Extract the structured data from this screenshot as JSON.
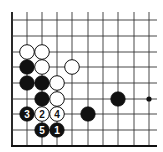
{
  "diagram": {
    "type": "go-board-fragment",
    "grid": {
      "columns_x": [
        12,
        27,
        42,
        57,
        72,
        88,
        103,
        118,
        134,
        149
      ],
      "rows_y": [
        20,
        36,
        52,
        67,
        83,
        99,
        114,
        130
      ],
      "top_y": 12,
      "right_x": 157,
      "bottom_edge_y": 146,
      "left_edge_x": 12,
      "line_color": "#333333",
      "edge_color": "#111111"
    },
    "stone_radius": 7.3,
    "colors": {
      "black": "#111111",
      "white": "#ffffff",
      "outline": "#111111"
    },
    "stones": [
      {
        "color": "white",
        "col": 1,
        "row": 2,
        "label": ""
      },
      {
        "color": "white",
        "col": 2,
        "row": 2,
        "label": ""
      },
      {
        "color": "black",
        "col": 1,
        "row": 3,
        "label": ""
      },
      {
        "color": "white",
        "col": 2,
        "row": 3,
        "label": ""
      },
      {
        "color": "white",
        "col": 4,
        "row": 3,
        "label": ""
      },
      {
        "color": "black",
        "col": 1,
        "row": 4,
        "label": ""
      },
      {
        "color": "black",
        "col": 2,
        "row": 4,
        "label": ""
      },
      {
        "color": "white",
        "col": 3,
        "row": 4,
        "label": ""
      },
      {
        "color": "black",
        "col": 2,
        "row": 5,
        "label": ""
      },
      {
        "color": "white",
        "col": 3,
        "row": 5,
        "label": ""
      },
      {
        "color": "black",
        "col": 7,
        "row": 5,
        "label": ""
      },
      {
        "color": "black",
        "col": 1,
        "row": 6,
        "label": "3"
      },
      {
        "color": "white",
        "col": 2,
        "row": 6,
        "label": "2"
      },
      {
        "color": "white",
        "col": 3,
        "row": 6,
        "label": "4"
      },
      {
        "color": "black",
        "col": 5,
        "row": 6,
        "label": ""
      },
      {
        "color": "black",
        "col": 2,
        "row": 7,
        "label": "5"
      },
      {
        "color": "black",
        "col": 3,
        "row": 7,
        "label": "1"
      }
    ],
    "star_points": [
      {
        "col": 9,
        "row": 5
      }
    ],
    "move_labels": [
      "1",
      "2",
      "3",
      "4",
      "5"
    ]
  }
}
